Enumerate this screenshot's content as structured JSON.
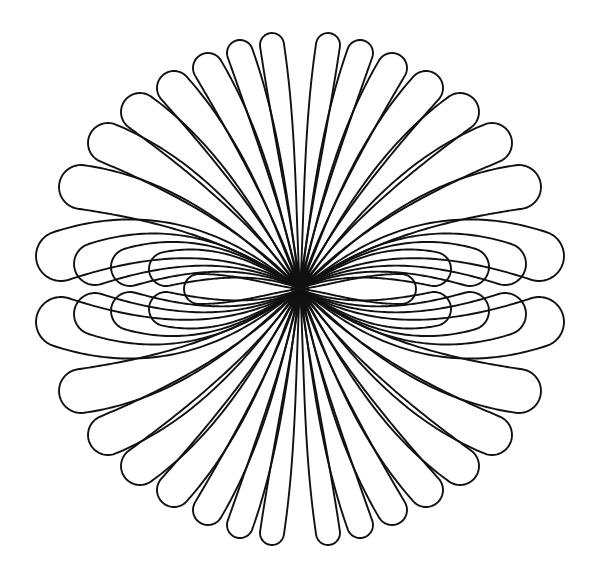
{
  "artwork": {
    "kind": "line-art petal rosette",
    "canvas": {
      "width": 599,
      "height": 575
    },
    "background": "#ffffff",
    "stroke_color": "#111111",
    "stroke_width": 1.9,
    "center": {
      "x": 300,
      "y": 289
    },
    "symmetry": "mirror-x-and-y",
    "petal_count_total": 46,
    "quadrant_petals": [
      {
        "name": "fan-1",
        "tip": [
          28,
          244
        ],
        "depart_deg": 85,
        "half_width": 12
      },
      {
        "name": "fan-2",
        "tip": [
          60,
          236
        ],
        "depart_deg": 80,
        "half_width": 13
      },
      {
        "name": "fan-3",
        "tip": [
          92,
          221
        ],
        "depart_deg": 74,
        "half_width": 15
      },
      {
        "name": "fan-4",
        "tip": [
          126,
          201
        ],
        "depart_deg": 66,
        "half_width": 17
      },
      {
        "name": "fan-5",
        "tip": [
          160,
          177
        ],
        "depart_deg": 58,
        "half_width": 19
      },
      {
        "name": "fan-6",
        "tip": [
          192,
          146
        ],
        "depart_deg": 50,
        "half_width": 20
      },
      {
        "name": "fan-7",
        "tip": [
          219,
          102
        ],
        "depart_deg": 40,
        "half_width": 22
      },
      {
        "name": "outer-big",
        "tip": [
          239,
          33
        ],
        "depart_deg": 35,
        "half_width": 25
      },
      {
        "name": "nested-1",
        "tip": [
          205,
          25
        ],
        "depart_deg": 32,
        "half_width": 21
      },
      {
        "name": "nested-2",
        "tip": [
          170,
          22
        ],
        "depart_deg": 30,
        "half_width": 19
      },
      {
        "name": "nested-3",
        "tip": [
          134,
          20
        ],
        "depart_deg": 27,
        "half_width": 17
      }
    ],
    "axis_petals": [
      {
        "name": "horizontal-inner",
        "tip": [
          101,
          0
        ],
        "half_width": 15
      }
    ]
  }
}
